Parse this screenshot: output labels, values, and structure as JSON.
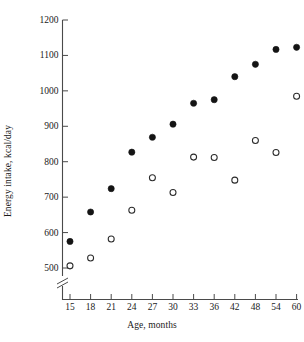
{
  "chart_data": {
    "type": "scatter",
    "title": "",
    "xlabel": "Age, months",
    "ylabel": "Energy intake, kcal/day",
    "categories": [
      15,
      18,
      21,
      24,
      27,
      30,
      33,
      36,
      42,
      48,
      54,
      60
    ],
    "xtick_labels": [
      "15",
      "18",
      "21",
      "24",
      "27",
      "30",
      "33",
      "36",
      "42",
      "48",
      "54",
      "60"
    ],
    "ytick_labels": [
      "500",
      "600",
      "700",
      "800",
      "900",
      "1000",
      "1100",
      "1200"
    ],
    "ytick_values": [
      500,
      600,
      700,
      800,
      900,
      1000,
      1100,
      1200
    ],
    "ylim": [
      500,
      1200
    ],
    "y_axis_break": true,
    "grid": false,
    "legend": "none",
    "series": [
      {
        "name": "closed-circles",
        "marker": "filled-circle",
        "color": "#141414",
        "values": [
          575,
          658,
          724,
          827,
          869,
          906,
          965,
          975,
          1040,
          1075,
          1117,
          1123
        ]
      },
      {
        "name": "open-circles",
        "marker": "open-circle",
        "color": "#ffffff",
        "values": [
          506,
          528,
          582,
          663,
          755,
          713,
          813,
          812,
          748,
          860,
          826,
          985
        ]
      }
    ]
  },
  "axis": {
    "x_break_marker": "axis-break",
    "tick_color": "#4a4a4a",
    "axis_color": "#4a4a4a"
  }
}
